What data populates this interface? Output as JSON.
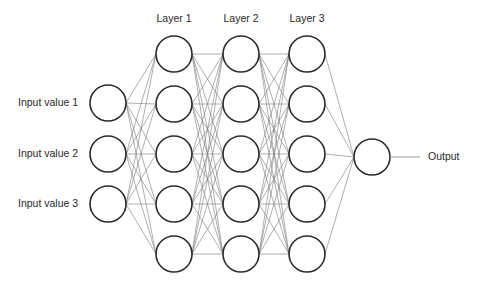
{
  "colors": {
    "node_stroke": "#2b2b2b",
    "edge": "#7a7a7a",
    "background": "#ffffff",
    "text": "#2a2a2a"
  },
  "layers": [
    {
      "name": "input",
      "label": "",
      "x": 108,
      "nodes": [
        103,
        154,
        204
      ]
    },
    {
      "name": "layer1",
      "label": "Layer 1",
      "x": 174,
      "nodes": [
        54,
        104,
        154,
        204,
        254
      ]
    },
    {
      "name": "layer2",
      "label": "Layer 2",
      "x": 241,
      "nodes": [
        54,
        104,
        154,
        204,
        254
      ]
    },
    {
      "name": "layer3",
      "label": "Layer 3",
      "x": 307,
      "nodes": [
        54,
        104,
        154,
        204,
        254
      ]
    },
    {
      "name": "output",
      "label": "",
      "x": 372,
      "nodes": [
        157
      ]
    }
  ],
  "node_radius": 18,
  "input_labels": [
    "Input value 1",
    "Input value 2",
    "Input value 3"
  ],
  "layer_labels": [
    "Layer 1",
    "Layer 2",
    "Layer 3"
  ],
  "output_label": "Output"
}
